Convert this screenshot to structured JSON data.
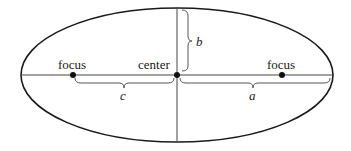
{
  "diagram": {
    "type": "ellipse-anatomy",
    "labels": {
      "left_focus": "focus",
      "right_focus": "focus",
      "center": "center",
      "semi_minor": "b",
      "semi_major": "a",
      "focal_distance": "c"
    },
    "colors": {
      "stroke": "#1a1a1a",
      "axis": "#444444",
      "brace": "#555555",
      "background": "#ffffff"
    }
  }
}
